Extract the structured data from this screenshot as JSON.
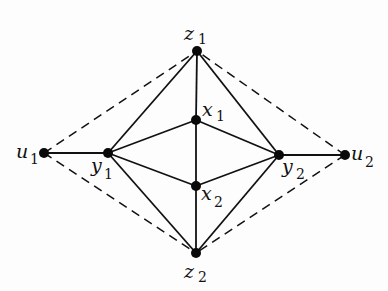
{
  "diagram": {
    "type": "graph",
    "nodes": [
      {
        "id": "z1",
        "name": "z",
        "sub": "1",
        "x": 197,
        "y": 51,
        "lx": 184,
        "ly": 40,
        "sx": 198,
        "sy": 44
      },
      {
        "id": "x1",
        "name": "x",
        "sub": "1",
        "x": 196,
        "y": 120,
        "lx": 202,
        "ly": 116,
        "sx": 216,
        "sy": 121
      },
      {
        "id": "u1",
        "name": "u",
        "sub": "1",
        "x": 44,
        "y": 153,
        "lx": 16,
        "ly": 158,
        "sx": 30,
        "sy": 164
      },
      {
        "id": "y1",
        "name": "y",
        "sub": "1",
        "x": 108,
        "y": 153,
        "lx": 91,
        "ly": 172,
        "sx": 104,
        "sy": 179
      },
      {
        "id": "y2",
        "name": "y",
        "sub": "2",
        "x": 279,
        "y": 155,
        "lx": 282,
        "ly": 173,
        "sx": 296,
        "sy": 179
      },
      {
        "id": "u2",
        "name": "u",
        "sub": "2",
        "x": 345,
        "y": 155,
        "lx": 351,
        "ly": 160,
        "sx": 365,
        "sy": 167
      },
      {
        "id": "x2",
        "name": "x",
        "sub": "2",
        "x": 196,
        "y": 186,
        "lx": 201,
        "ly": 200,
        "sx": 214,
        "sy": 207
      },
      {
        "id": "z2",
        "name": "z",
        "sub": "2",
        "x": 196,
        "y": 253,
        "lx": 184,
        "ly": 278,
        "sx": 198,
        "sy": 282
      }
    ],
    "solid_edges": [
      [
        "u1",
        "y1"
      ],
      [
        "y2",
        "u2"
      ],
      [
        "y1",
        "z1"
      ],
      [
        "y1",
        "x1"
      ],
      [
        "y1",
        "x2"
      ],
      [
        "y1",
        "z2"
      ],
      [
        "y2",
        "z1"
      ],
      [
        "y2",
        "x1"
      ],
      [
        "y2",
        "x2"
      ],
      [
        "y2",
        "z2"
      ],
      [
        "z1",
        "x1"
      ],
      [
        "x1",
        "x2"
      ],
      [
        "x2",
        "z2"
      ]
    ],
    "dashed_edges": [
      [
        "u1",
        "z1"
      ],
      [
        "u1",
        "z2"
      ],
      [
        "u2",
        "z1"
      ],
      [
        "u2",
        "z2"
      ]
    ],
    "labels": {
      "z1": "z1",
      "x1": "x1",
      "u1": "u1",
      "y1": "y1",
      "y2": "y2",
      "u2": "u2",
      "x2": "x2",
      "z2": "z2"
    }
  }
}
